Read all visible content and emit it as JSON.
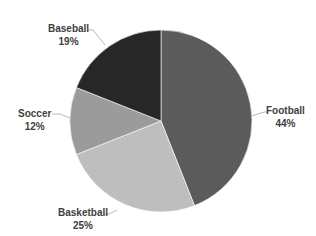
{
  "chart_data": {
    "type": "pie",
    "title": "",
    "categories": [
      "Football",
      "Basketball",
      "Soccer",
      "Baseball"
    ],
    "values": [
      44,
      25,
      12,
      19
    ],
    "unit": "%",
    "colors": [
      "#5b5b5b",
      "#bebebe",
      "#9b9b9b",
      "#272727"
    ],
    "start_angle_deg": 0,
    "direction": "clockwise",
    "legend": "none",
    "data_labels": [
      {
        "name": "Football",
        "value": "44%"
      },
      {
        "name": "Basketball",
        "value": "25%"
      },
      {
        "name": "Soccer",
        "value": "12%"
      },
      {
        "name": "Baseball",
        "value": "19%"
      }
    ]
  }
}
